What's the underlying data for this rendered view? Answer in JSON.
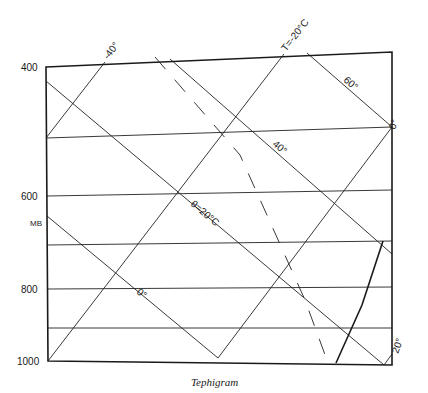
{
  "diagram": {
    "title": "Tephigram",
    "caption": "Tephigram",
    "pressure_axis": {
      "unit_label": "MB",
      "ticks": [
        {
          "label": "400",
          "y": 67
        },
        {
          "label": "600",
          "y": 196
        },
        {
          "label": "800",
          "y": 289
        },
        {
          "label": "1000",
          "y": 361
        }
      ]
    },
    "isotherm_labels": {
      "minus40": "-40°",
      "minus20": "T=-20°C",
      "zero": "0°",
      "twenty": "20°"
    },
    "adiabat_labels": {
      "sixty": "60°",
      "forty": "40°",
      "theta20": "θ=20°C",
      "zero": "0°"
    },
    "colors": {
      "ink": "#1a1a1a",
      "background": "#ffffff"
    }
  }
}
